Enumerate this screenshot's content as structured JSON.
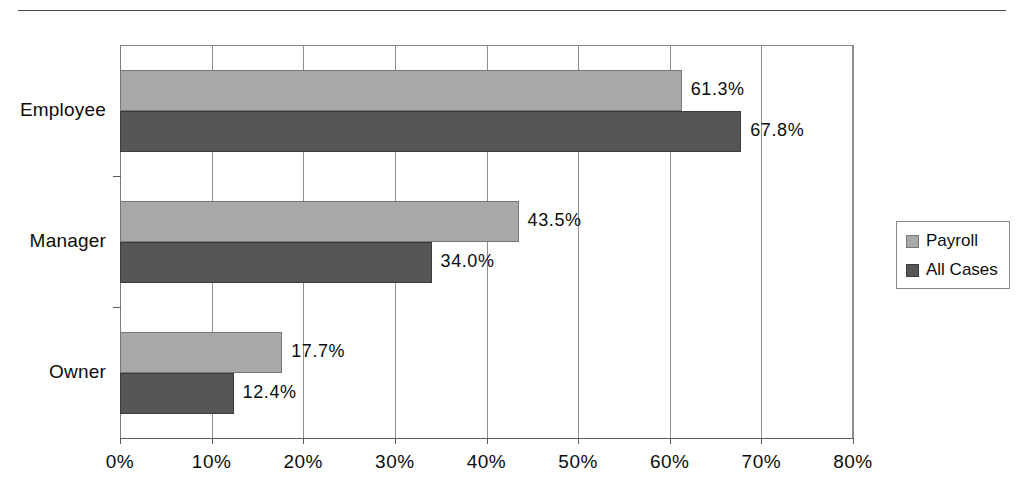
{
  "chart_data": {
    "type": "bar",
    "orientation": "horizontal",
    "title": "",
    "subtitle": "",
    "xlabel": "",
    "ylabel": "",
    "categories": [
      "Employee",
      "Manager",
      "Owner"
    ],
    "series": [
      {
        "name": "Payroll",
        "color": "#a9a9a9",
        "values": [
          61.3,
          43.5,
          17.7
        ],
        "labels": [
          "61.3%",
          "43.5%",
          "17.7%"
        ]
      },
      {
        "name": "All Cases",
        "color": "#565656",
        "values": [
          67.8,
          34.0,
          12.4
        ],
        "labels": [
          "67.8%",
          "34.0%",
          "12.4%"
        ]
      }
    ],
    "xlim": [
      0,
      80
    ],
    "xticks": [
      0,
      10,
      20,
      30,
      40,
      50,
      60,
      70,
      80
    ],
    "xticklabels": [
      "0%",
      "10%",
      "20%",
      "30%",
      "40%",
      "50%",
      "60%",
      "70%",
      "80%"
    ],
    "grid": true,
    "grid_axis": "x",
    "legend": {
      "position": "right",
      "entries": [
        "Payroll",
        "All Cases"
      ]
    },
    "value_labels": true,
    "value_label_suffix": "%"
  },
  "figure": {
    "top_rule": true,
    "background_color": "#ffffff",
    "axis_color": "#5a5a5a",
    "grid_color": "#8e8e8e",
    "text_color": "#0d0d0d"
  }
}
